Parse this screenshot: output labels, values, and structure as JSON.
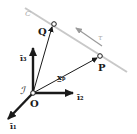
{
  "diagram": {
    "origin_label": "O",
    "frame_label": "ℐ",
    "axes": [
      {
        "id": "i1",
        "label": "ī₁"
      },
      {
        "id": "i2",
        "label": "ī₂"
      },
      {
        "id": "i3",
        "label": "ī₃"
      }
    ],
    "points": [
      {
        "id": "Q",
        "label": "Q"
      },
      {
        "id": "P",
        "label": "P"
      }
    ],
    "vector_label": "x̲ₚ",
    "curve_label": "C",
    "tangent_label": "τ",
    "colors": {
      "ink": "#1a1a1a",
      "curve": "#c8c8c8"
    }
  }
}
